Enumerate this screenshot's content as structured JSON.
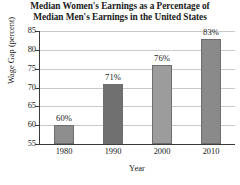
{
  "chart_data": {
    "type": "bar",
    "title": "Median Women's Earnings as a Percentage of Median Men's Earnings in the United States",
    "title_lines": [
      "Median Women's Earnings as a Percentage of",
      "Median Men's Earnings in the United States"
    ],
    "xlabel": "Year",
    "ylabel": "Wage Gap (percent)",
    "categories": [
      "1980",
      "1990",
      "2000",
      "2010"
    ],
    "values": [
      60,
      71,
      76,
      83
    ],
    "value_labels": [
      "60%",
      "71%",
      "76%",
      "83%"
    ],
    "ylim": [
      55,
      85
    ],
    "yticks": [
      85,
      80,
      75,
      70,
      65,
      60,
      55
    ],
    "ytick_labels": [
      "85",
      "80",
      "75",
      "70",
      "65",
      "60",
      "55"
    ],
    "grid": "horizontal",
    "legend": "none",
    "bar_colors": [
      "#8e8e8e",
      "#707070",
      "#9c9c9c",
      "#8a8a8a"
    ],
    "bar_edge_color": "#6e6e6e",
    "axis_color": "#3a3a3a",
    "gridline_color": "#c9c9c9",
    "background_color": "#ffffff"
  }
}
